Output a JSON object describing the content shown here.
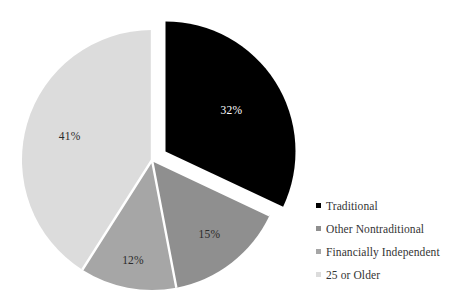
{
  "chart_data": {
    "type": "pie",
    "title": "",
    "subtitle": "",
    "xlabel": "",
    "ylabel": "",
    "grid": false,
    "legend_position": "right",
    "start_angle_deg": 0,
    "direction": "clockwise",
    "categories": [
      "Traditional",
      "Other Nontraditional",
      "Financially Independent",
      "25 or Older"
    ],
    "values": [
      32,
      15,
      12,
      41
    ],
    "value_unit": "%",
    "data_labels": [
      "32%",
      "15%",
      "12%",
      "41%"
    ],
    "colors": [
      "#000000",
      "#8f8f8f",
      "#a6a6a6",
      "#dcdcdc"
    ],
    "label_colors": [
      "#ffffff",
      "#2b2b2b",
      "#2b2b2b",
      "#2b2b2b"
    ],
    "exploded": [
      true,
      false,
      false,
      false
    ],
    "slices": [
      {
        "label": "Traditional",
        "value": 32,
        "data_label": "32%",
        "color": "#000000",
        "exploded": true
      },
      {
        "label": "Other Nontraditional",
        "value": 15,
        "data_label": "15%",
        "color": "#8f8f8f",
        "exploded": false
      },
      {
        "label": "Financially Independent",
        "value": 12,
        "data_label": "12%",
        "color": "#a6a6a6",
        "exploded": false
      },
      {
        "label": "25 or Older",
        "value": 41,
        "data_label": "41%",
        "color": "#dcdcdc",
        "exploded": false
      }
    ]
  },
  "legend": {
    "items": [
      {
        "label": "Traditional",
        "color": "#000000"
      },
      {
        "label": "Other Nontraditional",
        "color": "#8f8f8f"
      },
      {
        "label": "Financially Independent",
        "color": "#a6a6a6"
      },
      {
        "label": "25 or Older",
        "color": "#dcdcdc"
      }
    ]
  },
  "slice_label_text": {
    "s0": "32%",
    "s1": "15%",
    "s2": "12%",
    "s3": "41%"
  }
}
